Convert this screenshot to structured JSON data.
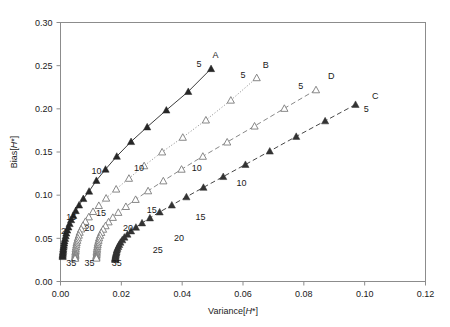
{
  "chart_data": {
    "type": "line",
    "title": "",
    "subtitle": "",
    "xlabel": "Variance[H*]",
    "ylabel": "Bias[H*]",
    "xlim": [
      0.0,
      0.12
    ],
    "ylim": [
      0.0,
      0.3
    ],
    "xticks": [
      0.0,
      0.02,
      0.04,
      0.06,
      0.08,
      0.1,
      0.12
    ],
    "xticklabels": [
      "0.00",
      "0.02",
      "0.04",
      "0.06",
      "0.08",
      "0.10",
      "0.12"
    ],
    "yticks": [
      0.0,
      0.05,
      0.1,
      0.15,
      0.2,
      0.25,
      0.3
    ],
    "yticklabels": [
      "0.00",
      "0.05",
      "0.10",
      "0.15",
      "0.20",
      "0.25",
      "0.30"
    ],
    "grid": false,
    "legend_position": "inline-end-labels",
    "annotations": [
      {
        "text": "A",
        "x": 0.051,
        "y": 0.259
      },
      {
        "text": "5",
        "x": 0.0455,
        "y": 0.248
      },
      {
        "text": "10",
        "x": 0.0118,
        "y": 0.125
      },
      {
        "text": "15",
        "x": 0.0035,
        "y": 0.0715
      },
      {
        "text": "2",
        "x": 0.001,
        "y": 0.0545
      },
      {
        "text": "35",
        "x": 0.0035,
        "y": 0.0175
      },
      {
        "text": "B",
        "x": 0.0675,
        "y": 0.247
      },
      {
        "text": "5",
        "x": 0.06,
        "y": 0.236
      },
      {
        "text": "10",
        "x": 0.0258,
        "y": 0.1275
      },
      {
        "text": "15",
        "x": 0.0133,
        "y": 0.076
      },
      {
        "text": "20",
        "x": 0.0095,
        "y": 0.0585
      },
      {
        "text": "35",
        "x": 0.0095,
        "y": 0.0175
      },
      {
        "text": "D",
        "x": 0.089,
        "y": 0.2345
      },
      {
        "text": "5",
        "x": 0.079,
        "y": 0.2235
      },
      {
        "text": "10",
        "x": 0.0448,
        "y": 0.1285
      },
      {
        "text": "15",
        "x": 0.03,
        "y": 0.079
      },
      {
        "text": "20",
        "x": 0.0222,
        "y": 0.0585
      },
      {
        "text": "35",
        "x": 0.0185,
        "y": 0.0175
      },
      {
        "text": "C",
        "x": 0.1035,
        "y": 0.211
      },
      {
        "text": "5",
        "x": 0.1005,
        "y": 0.1965
      },
      {
        "text": "10",
        "x": 0.0595,
        "y": 0.1105
      },
      {
        "text": "15",
        "x": 0.046,
        "y": 0.071
      },
      {
        "text": "20",
        "x": 0.039,
        "y": 0.047
      },
      {
        "text": "25",
        "x": 0.032,
        "y": 0.033
      }
    ],
    "series": [
      {
        "name": "A",
        "label": "A",
        "marker": "filled-triangle",
        "linestyle": "solid",
        "color": "#262626",
        "start_label": "35",
        "end_label": "5",
        "points": [
          [
            0.0495,
            0.2465
          ],
          [
            0.042,
            0.22
          ],
          [
            0.0348,
            0.1985
          ],
          [
            0.0285,
            0.179
          ],
          [
            0.0232,
            0.162
          ],
          [
            0.0185,
            0.145
          ],
          [
            0.0148,
            0.13
          ],
          [
            0.0118,
            0.117
          ],
          [
            0.0094,
            0.1045
          ],
          [
            0.0075,
            0.096
          ],
          [
            0.0061,
            0.0885
          ],
          [
            0.005,
            0.082
          ],
          [
            0.0042,
            0.0765
          ],
          [
            0.0035,
            0.0715
          ],
          [
            0.003,
            0.067
          ],
          [
            0.0026,
            0.063
          ],
          [
            0.0022,
            0.0595
          ],
          [
            0.0019,
            0.056
          ],
          [
            0.0017,
            0.0528
          ],
          [
            0.0015,
            0.0498
          ],
          [
            0.0013,
            0.047
          ],
          [
            0.0012,
            0.0444
          ],
          [
            0.0011,
            0.042
          ],
          [
            0.001,
            0.0398
          ],
          [
            0.0009,
            0.0378
          ],
          [
            0.0009,
            0.036
          ],
          [
            0.0008,
            0.0343
          ],
          [
            0.0008,
            0.0327
          ],
          [
            0.0007,
            0.0313
          ],
          [
            0.0007,
            0.03
          ],
          [
            0.0007,
            0.0288
          ]
        ]
      },
      {
        "name": "B",
        "label": "B",
        "marker": "open-triangle",
        "linestyle": "dotted",
        "color": "#7a7a7a",
        "start_label": "35",
        "end_label": "5",
        "points": [
          [
            0.0645,
            0.236
          ],
          [
            0.056,
            0.21
          ],
          [
            0.0478,
            0.187
          ],
          [
            0.0402,
            0.167
          ],
          [
            0.0334,
            0.15
          ],
          [
            0.0275,
            0.134
          ],
          [
            0.0225,
            0.1195
          ],
          [
            0.0183,
            0.107
          ],
          [
            0.015,
            0.0965
          ],
          [
            0.0126,
            0.088
          ],
          [
            0.0107,
            0.081
          ],
          [
            0.0093,
            0.0748
          ],
          [
            0.0082,
            0.0695
          ],
          [
            0.0074,
            0.065
          ],
          [
            0.0068,
            0.0608
          ],
          [
            0.0063,
            0.057
          ],
          [
            0.006,
            0.0536
          ],
          [
            0.0057,
            0.0505
          ],
          [
            0.0055,
            0.0476
          ],
          [
            0.0053,
            0.045
          ],
          [
            0.0052,
            0.0425
          ],
          [
            0.0051,
            0.0402
          ],
          [
            0.005,
            0.038
          ],
          [
            0.005,
            0.036
          ],
          [
            0.0049,
            0.0342
          ],
          [
            0.0049,
            0.0326
          ],
          [
            0.0049,
            0.0312
          ],
          [
            0.0049,
            0.0298
          ],
          [
            0.0048,
            0.0286
          ],
          [
            0.0048,
            0.0276
          ],
          [
            0.0048,
            0.0268
          ]
        ]
      },
      {
        "name": "D",
        "label": "D",
        "marker": "open-triangle",
        "linestyle": "dashed",
        "color": "#7a7a7a",
        "start_label": "35",
        "end_label": "5",
        "points": [
          [
            0.084,
            0.222
          ],
          [
            0.0736,
            0.2005
          ],
          [
            0.0638,
            0.18
          ],
          [
            0.0548,
            0.1615
          ],
          [
            0.0468,
            0.145
          ],
          [
            0.0398,
            0.13
          ],
          [
            0.0338,
            0.1165
          ],
          [
            0.0288,
            0.105
          ],
          [
            0.0247,
            0.095
          ],
          [
            0.0215,
            0.0868
          ],
          [
            0.019,
            0.08
          ],
          [
            0.0172,
            0.0742
          ],
          [
            0.0158,
            0.069
          ],
          [
            0.0148,
            0.0645
          ],
          [
            0.014,
            0.0605
          ],
          [
            0.0134,
            0.0568
          ],
          [
            0.013,
            0.0535
          ],
          [
            0.0127,
            0.0505
          ],
          [
            0.0125,
            0.0476
          ],
          [
            0.0123,
            0.045
          ],
          [
            0.0122,
            0.0426
          ],
          [
            0.0121,
            0.0403
          ],
          [
            0.012,
            0.0382
          ],
          [
            0.012,
            0.0362
          ],
          [
            0.0119,
            0.0345
          ],
          [
            0.0119,
            0.0329
          ],
          [
            0.0119,
            0.0314
          ],
          [
            0.0118,
            0.0301
          ],
          [
            0.0118,
            0.0289
          ],
          [
            0.0118,
            0.0279
          ],
          [
            0.0118,
            0.027
          ]
        ]
      },
      {
        "name": "C",
        "label": "C",
        "marker": "filled-triangle",
        "linestyle": "dashed",
        "color": "#333333",
        "start_label": "35",
        "end_label": "5",
        "points": [
          [
            0.097,
            0.205
          ],
          [
            0.087,
            0.186
          ],
          [
            0.0775,
            0.168
          ],
          [
            0.0688,
            0.151
          ],
          [
            0.0608,
            0.1355
          ],
          [
            0.0535,
            0.1215
          ],
          [
            0.047,
            0.109
          ],
          [
            0.0414,
            0.098
          ],
          [
            0.0366,
            0.0885
          ],
          [
            0.0326,
            0.0805
          ],
          [
            0.0294,
            0.0736
          ],
          [
            0.0268,
            0.0678
          ],
          [
            0.0248,
            0.0628
          ],
          [
            0.0232,
            0.0585
          ],
          [
            0.022,
            0.0547
          ],
          [
            0.021,
            0.0513
          ],
          [
            0.0203,
            0.0482
          ],
          [
            0.0197,
            0.0454
          ],
          [
            0.0193,
            0.0428
          ],
          [
            0.019,
            0.0404
          ],
          [
            0.0187,
            0.0383
          ],
          [
            0.0185,
            0.0363
          ],
          [
            0.0184,
            0.0345
          ],
          [
            0.0183,
            0.0329
          ],
          [
            0.0182,
            0.0314
          ],
          [
            0.0181,
            0.0301
          ],
          [
            0.0181,
            0.0289
          ],
          [
            0.018,
            0.0278
          ],
          [
            0.018,
            0.0269
          ],
          [
            0.018,
            0.0261
          ],
          [
            0.018,
            0.0254
          ]
        ]
      }
    ]
  }
}
